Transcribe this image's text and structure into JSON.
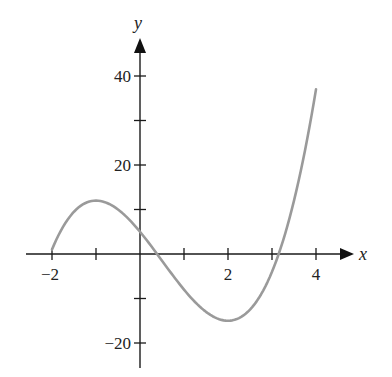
{
  "chart_data": {
    "type": "line",
    "title": "",
    "xlabel": "x",
    "ylabel": "y",
    "xlim": [
      -2.6,
      4.9
    ],
    "ylim": [
      -26,
      48
    ],
    "grid": false,
    "legend": null,
    "x_ticks": [
      -2,
      -1,
      0,
      1,
      2,
      3,
      4
    ],
    "x_tick_labels": [
      {
        "value": -2,
        "label": "−2"
      },
      {
        "value": 2,
        "label": "2"
      },
      {
        "value": 4,
        "label": "4"
      }
    ],
    "y_ticks": [
      -20,
      -10,
      10,
      20,
      30,
      40
    ],
    "y_tick_labels": [
      {
        "value": 40,
        "label": "40"
      },
      {
        "value": 20,
        "label": "20"
      },
      {
        "value": -20,
        "label": "−20"
      }
    ],
    "function": "y = 2x^3 - 3x^2 - 12x + 5",
    "domain": [
      -2,
      4
    ],
    "key_points": [
      {
        "x": -2,
        "y": 1,
        "note": "left endpoint"
      },
      {
        "x": -1,
        "y": 12,
        "note": "local maximum"
      },
      {
        "x": 0,
        "y": 5,
        "note": "y-intercept"
      },
      {
        "x": 2,
        "y": -15,
        "note": "local minimum"
      },
      {
        "x": 4,
        "y": 37,
        "note": "right endpoint"
      }
    ],
    "series": [
      {
        "name": "f(x)",
        "color": "#9a9a9a",
        "x": [
          -2,
          -1.5,
          -1,
          -0.5,
          0,
          0.5,
          1,
          1.5,
          2,
          2.5,
          3,
          3.5,
          4
        ],
        "values": [
          1,
          9.5,
          12,
          9.5,
          5,
          -1.5,
          -8,
          -13,
          -15,
          -12.5,
          -4,
          10.5,
          37
        ]
      }
    ]
  },
  "axes": {
    "x_name": "x",
    "y_name": "y"
  }
}
